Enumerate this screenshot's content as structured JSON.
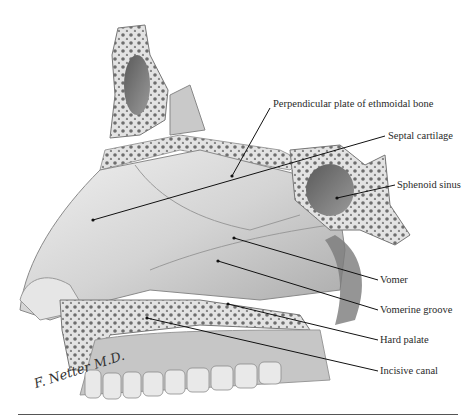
{
  "figure": {
    "labels": [
      {
        "id": "perpendicular-plate",
        "text": "Perpendicular plate of ethmoidal  bone",
        "x": 273,
        "y": 104
      },
      {
        "id": "septal-cartilage",
        "text": "Septal cartilage",
        "x": 388,
        "y": 132
      },
      {
        "id": "sphenoid-sinus",
        "text": "Sphenoid sinus",
        "x": 397,
        "y": 181
      },
      {
        "id": "vomer",
        "text": "Vomer",
        "x": 380,
        "y": 275
      },
      {
        "id": "vomerine-groove",
        "text": "Vomerine groove",
        "x": 380,
        "y": 305
      },
      {
        "id": "hard-palate",
        "text": "Hard palate",
        "x": 380,
        "y": 335
      },
      {
        "id": "incisive-canal",
        "text": "Incisive canal",
        "x": 380,
        "y": 366
      }
    ],
    "signature": "F. Netter M.D.",
    "colors": {
      "bone": "#d9d9d9",
      "bone_dark": "#8a8a8a",
      "leader_line": "#111111",
      "label_text": "#2a2a2a"
    }
  }
}
